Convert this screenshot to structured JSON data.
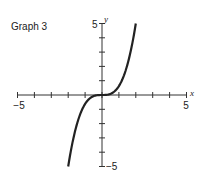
{
  "title": "Graph 3",
  "chart_data": {
    "type": "line",
    "title": "Graph 3",
    "xlabel": "x",
    "ylabel": "y",
    "xlim": [
      -5,
      5
    ],
    "ylim": [
      -5,
      5
    ],
    "xtick_labels": [
      "-5",
      "5"
    ],
    "ytick_labels": [
      "5",
      "-5"
    ],
    "xticks": [
      -5,
      -4,
      -3,
      -2,
      -1,
      0,
      1,
      2,
      3,
      4,
      5
    ],
    "yticks": [
      -5,
      -4,
      -3,
      -2,
      -1,
      0,
      1,
      2,
      3,
      4,
      5
    ],
    "grid": false,
    "series": [
      {
        "name": "cubic curve",
        "function": "y ≈ 0.625·x³",
        "x": [
          -2,
          -1.5,
          -1,
          -0.5,
          0,
          0.5,
          1,
          1.5,
          2
        ],
        "y": [
          -5,
          -2.11,
          -0.63,
          -0.08,
          0,
          0.08,
          0.63,
          2.11,
          5
        ],
        "color": "#222222"
      }
    ]
  }
}
